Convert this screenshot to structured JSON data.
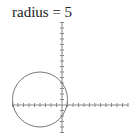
{
  "title": "radius = 5",
  "chart_data": {
    "type": "line",
    "title": "radius = 5",
    "xlabel": "",
    "ylabel": "",
    "grid": false,
    "shape": "circle",
    "circle": {
      "center": [
        -4,
        1
      ],
      "radius": 5
    },
    "xlim": [
      -9,
      12
    ],
    "ylim": [
      -5,
      15
    ],
    "tick_spacing": 1
  },
  "style": {
    "axis_color": "#888888",
    "curve_color": "#777777"
  }
}
